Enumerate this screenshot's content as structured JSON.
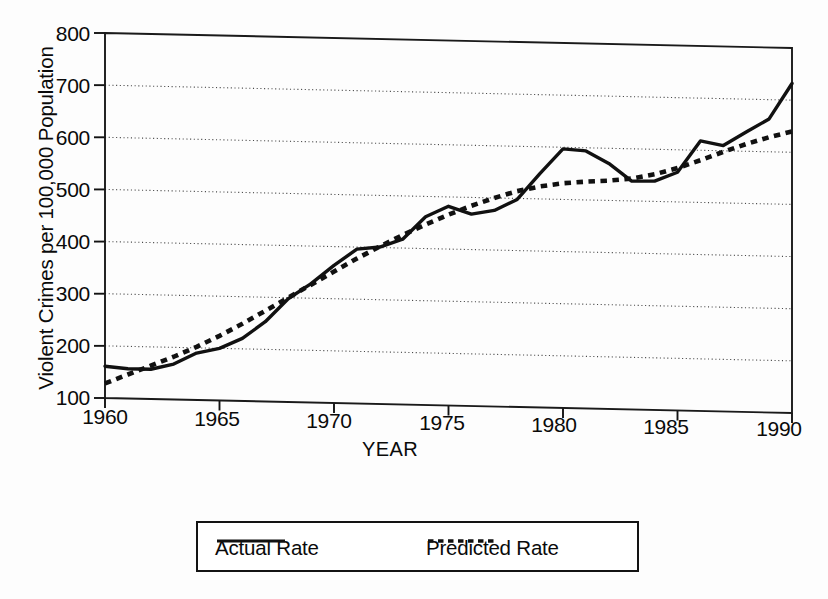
{
  "chart_data": {
    "type": "line",
    "title": "",
    "xlabel": "YEAR",
    "ylabel": "Violent Crimes per 100,000 Population",
    "xlim": [
      1960,
      1990
    ],
    "ylim": [
      100,
      800
    ],
    "xticks": [
      "1960",
      "1965",
      "1970",
      "1975",
      "1980",
      "1985",
      "1990"
    ],
    "yticks": [
      "100",
      "200",
      "300",
      "400",
      "500",
      "600",
      "700",
      "800"
    ],
    "grid": "horizontal-dotted",
    "legend_position": "below-plot-center",
    "x": [
      1960,
      1961,
      1962,
      1963,
      1964,
      1965,
      1966,
      1967,
      1968,
      1969,
      1970,
      1971,
      1972,
      1973,
      1974,
      1975,
      1976,
      1977,
      1978,
      1979,
      1980,
      1981,
      1982,
      1983,
      1984,
      1985,
      1986,
      1987,
      1988,
      1989,
      1990
    ],
    "series": [
      {
        "name": "Actual Rate",
        "style": "solid",
        "color": "#111111",
        "values": [
          161,
          157,
          157,
          168,
          190,
          200,
          220,
          253,
          298,
          328,
          364,
          396,
          401,
          417,
          461,
          482,
          468,
          476,
          498,
          549,
          597,
          594,
          571,
          538,
          539,
          557,
          618,
          610,
          637,
          663,
          732
        ]
      },
      {
        "name": "Predicted Rate",
        "style": "dotted",
        "color": "#111111",
        "values": [
          128,
          146,
          164,
          182,
          202,
          224,
          248,
          274,
          300,
          326,
          352,
          378,
          402,
          425,
          446,
          466,
          484,
          500,
          514,
          524,
          531,
          535,
          538,
          543,
          552,
          565,
          581,
          598,
          614,
          628,
          640
        ]
      }
    ]
  },
  "legend": {
    "entries": [
      {
        "label": "Actual Rate",
        "style": "solid"
      },
      {
        "label": "Predicted Rate",
        "style": "dotted"
      }
    ]
  },
  "axes": {
    "x_title": "YEAR",
    "y_title": "Violent Crimes per 100,000 Population",
    "x_tick_labels": [
      "1960",
      "1965",
      "1970",
      "1975",
      "1980",
      "1985",
      "1990"
    ],
    "y_tick_labels": [
      "800",
      "700",
      "600",
      "500",
      "400",
      "300",
      "200",
      "100"
    ]
  }
}
